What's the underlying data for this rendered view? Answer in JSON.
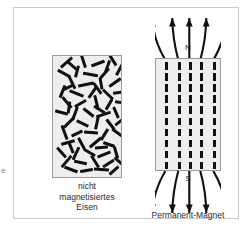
{
  "figure": {
    "margin_glyph": "e",
    "background_color": "#ffffff",
    "frame_color": "#c9c9c9",
    "block_fill": "#eeeeee",
    "domain_color": "#111111"
  },
  "panel_a": {
    "caption_line1": "nicht",
    "caption_line2": "magnetisiertes",
    "caption_line3": "Eisen",
    "panel_letter": "a",
    "block": {
      "x": 38,
      "y": 47,
      "width": 70,
      "height": 123
    },
    "domain_count": 64,
    "domains": [
      {
        "x": 6,
        "y": 5,
        "len": 15,
        "w": 3.0,
        "rot": -42
      },
      {
        "x": 24,
        "y": 4,
        "len": 13,
        "w": 3.0,
        "rot": 72
      },
      {
        "x": 38,
        "y": 6,
        "len": 14,
        "w": 3.0,
        "rot": -20
      },
      {
        "x": 54,
        "y": 3,
        "len": 12,
        "w": 3.0,
        "rot": 58
      },
      {
        "x": 60,
        "y": 12,
        "len": 13,
        "w": 3.0,
        "rot": -62
      },
      {
        "x": 4,
        "y": 16,
        "len": 14,
        "w": 3.0,
        "rot": 28
      },
      {
        "x": 18,
        "y": 14,
        "len": 12,
        "w": 3.0,
        "rot": -75
      },
      {
        "x": 30,
        "y": 17,
        "len": 15,
        "w": 3.0,
        "rot": 10
      },
      {
        "x": 45,
        "y": 16,
        "len": 13,
        "w": 3.0,
        "rot": -48
      },
      {
        "x": 12,
        "y": 25,
        "len": 14,
        "w": 3.0,
        "rot": 64
      },
      {
        "x": 25,
        "y": 27,
        "len": 16,
        "w": 3.0,
        "rot": -12
      },
      {
        "x": 42,
        "y": 26,
        "len": 12,
        "w": 3.0,
        "rot": 80
      },
      {
        "x": 55,
        "y": 25,
        "len": 14,
        "w": 3.0,
        "rot": -35
      },
      {
        "x": 3,
        "y": 34,
        "len": 13,
        "w": 3.0,
        "rot": -68
      },
      {
        "x": 16,
        "y": 36,
        "len": 15,
        "w": 3.0,
        "rot": 22
      },
      {
        "x": 33,
        "y": 35,
        "len": 13,
        "w": 3.0,
        "rot": -55
      },
      {
        "x": 48,
        "y": 37,
        "len": 14,
        "w": 3.0,
        "rot": 44
      },
      {
        "x": 60,
        "y": 35,
        "len": 12,
        "w": 3.0,
        "rot": -8
      },
      {
        "x": 7,
        "y": 45,
        "len": 14,
        "w": 3.0,
        "rot": 50
      },
      {
        "x": 21,
        "y": 46,
        "len": 13,
        "w": 3.0,
        "rot": -30
      },
      {
        "x": 36,
        "y": 45,
        "len": 15,
        "w": 3.0,
        "rot": 76
      },
      {
        "x": 50,
        "y": 47,
        "len": 12,
        "w": 3.0,
        "rot": -60
      },
      {
        "x": 2,
        "y": 55,
        "len": 13,
        "w": 3.0,
        "rot": 15
      },
      {
        "x": 15,
        "y": 56,
        "len": 14,
        "w": 3.0,
        "rot": -70
      },
      {
        "x": 29,
        "y": 55,
        "len": 13,
        "w": 3.0,
        "rot": 38
      },
      {
        "x": 43,
        "y": 57,
        "len": 15,
        "w": 3.0,
        "rot": -18
      },
      {
        "x": 57,
        "y": 55,
        "len": 12,
        "w": 3.0,
        "rot": 66
      },
      {
        "x": 9,
        "y": 65,
        "len": 14,
        "w": 3.0,
        "rot": -45
      },
      {
        "x": 23,
        "y": 66,
        "len": 13,
        "w": 3.0,
        "rot": 25
      },
      {
        "x": 37,
        "y": 65,
        "len": 14,
        "w": 3.0,
        "rot": -78
      },
      {
        "x": 51,
        "y": 67,
        "len": 13,
        "w": 3.0,
        "rot": 52
      },
      {
        "x": 4,
        "y": 75,
        "len": 15,
        "w": 3.0,
        "rot": 70
      },
      {
        "x": 18,
        "y": 76,
        "len": 12,
        "w": 3.0,
        "rot": -25
      },
      {
        "x": 31,
        "y": 75,
        "len": 14,
        "w": 3.0,
        "rot": 5
      },
      {
        "x": 45,
        "y": 77,
        "len": 13,
        "w": 3.0,
        "rot": -58
      },
      {
        "x": 58,
        "y": 75,
        "len": 12,
        "w": 3.0,
        "rot": 35
      },
      {
        "x": 8,
        "y": 85,
        "len": 14,
        "w": 3.0,
        "rot": -15
      },
      {
        "x": 22,
        "y": 86,
        "len": 13,
        "w": 3.0,
        "rot": 62
      },
      {
        "x": 35,
        "y": 85,
        "len": 15,
        "w": 3.0,
        "rot": -40
      },
      {
        "x": 50,
        "y": 87,
        "len": 12,
        "w": 3.0,
        "rot": 18
      },
      {
        "x": 2,
        "y": 95,
        "len": 13,
        "w": 3.0,
        "rot": 48
      },
      {
        "x": 16,
        "y": 96,
        "len": 14,
        "w": 3.0,
        "rot": -65
      },
      {
        "x": 30,
        "y": 95,
        "len": 13,
        "w": 3.0,
        "rot": 30
      },
      {
        "x": 44,
        "y": 97,
        "len": 14,
        "w": 3.0,
        "rot": -22
      },
      {
        "x": 57,
        "y": 95,
        "len": 12,
        "w": 3.0,
        "rot": 74
      },
      {
        "x": 6,
        "y": 104,
        "len": 15,
        "w": 3.0,
        "rot": -50
      },
      {
        "x": 21,
        "y": 105,
        "len": 13,
        "w": 3.0,
        "rot": 12
      },
      {
        "x": 35,
        "y": 104,
        "len": 14,
        "w": 3.0,
        "rot": 58
      },
      {
        "x": 49,
        "y": 106,
        "len": 13,
        "w": 3.0,
        "rot": -32
      },
      {
        "x": 11,
        "y": 112,
        "len": 14,
        "w": 3.0,
        "rot": 20
      },
      {
        "x": 27,
        "y": 113,
        "len": 13,
        "w": 3.0,
        "rot": -10
      },
      {
        "x": 41,
        "y": 112,
        "len": 15,
        "w": 3.0,
        "rot": 5
      },
      {
        "x": 55,
        "y": 113,
        "len": 12,
        "w": 3.0,
        "rot": -42
      },
      {
        "x": 13,
        "y": 8,
        "len": 12,
        "w": 3.0,
        "rot": 40
      },
      {
        "x": 48,
        "y": 9,
        "len": 13,
        "w": 3.0,
        "rot": -70
      },
      {
        "x": 9,
        "y": 30,
        "len": 12,
        "w": 3.0,
        "rot": -25
      },
      {
        "x": 38,
        "y": 31,
        "len": 13,
        "w": 3.0,
        "rot": 55
      },
      {
        "x": 62,
        "y": 45,
        "len": 12,
        "w": 3.0,
        "rot": 8
      },
      {
        "x": 10,
        "y": 50,
        "len": 12,
        "w": 3.0,
        "rot": -82
      },
      {
        "x": 40,
        "y": 52,
        "len": 13,
        "w": 3.0,
        "rot": 32
      },
      {
        "x": 61,
        "y": 64,
        "len": 12,
        "w": 3.0,
        "rot": -38
      },
      {
        "x": 12,
        "y": 90,
        "len": 12,
        "w": 3.0,
        "rot": 68
      },
      {
        "x": 42,
        "y": 90,
        "len": 13,
        "w": 3.0,
        "rot": -5
      },
      {
        "x": 60,
        "y": 104,
        "len": 12,
        "w": 3.0,
        "rot": 42
      }
    ]
  },
  "panel_b": {
    "caption": "Permanent-Magnet",
    "panel_letter": "b",
    "pole_north": "N",
    "pole_south": "S",
    "block": {
      "x": 141,
      "y": 50,
      "width": 66,
      "height": 113
    },
    "column_count": 5,
    "column_x": [
      9,
      22,
      33,
      44,
      57
    ],
    "dash_rows": 10,
    "dash_height": 7.5,
    "dash_gap": 3.6,
    "field_arrows_top": 5,
    "field_arrows_bottom": 5
  }
}
